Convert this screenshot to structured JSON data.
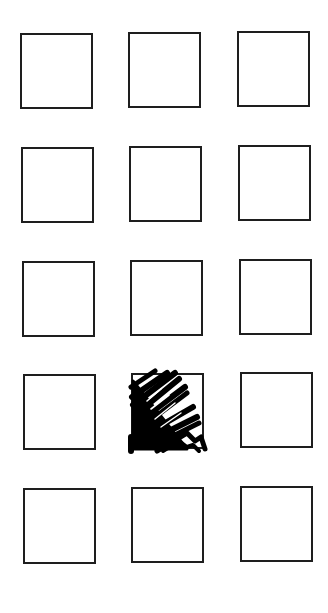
{
  "form": {
    "rows": 5,
    "columns": 3,
    "box_color": "#1e1e1e",
    "mark_color": "#000000",
    "boxes": [
      {
        "row": 1,
        "col": 1,
        "x": 20,
        "y": 33,
        "marked": false
      },
      {
        "row": 1,
        "col": 2,
        "x": 128,
        "y": 32,
        "marked": false
      },
      {
        "row": 1,
        "col": 3,
        "x": 237,
        "y": 31,
        "marked": false
      },
      {
        "row": 2,
        "col": 1,
        "x": 21,
        "y": 147,
        "marked": false
      },
      {
        "row": 2,
        "col": 2,
        "x": 129,
        "y": 146,
        "marked": false
      },
      {
        "row": 2,
        "col": 3,
        "x": 238,
        "y": 145,
        "marked": false
      },
      {
        "row": 3,
        "col": 1,
        "x": 22,
        "y": 261,
        "marked": false
      },
      {
        "row": 3,
        "col": 2,
        "x": 130,
        "y": 260,
        "marked": false
      },
      {
        "row": 3,
        "col": 3,
        "x": 239,
        "y": 259,
        "marked": false
      },
      {
        "row": 4,
        "col": 1,
        "x": 23,
        "y": 374,
        "marked": false
      },
      {
        "row": 4,
        "col": 2,
        "x": 131,
        "y": 373,
        "marked": true
      },
      {
        "row": 4,
        "col": 3,
        "x": 240,
        "y": 372,
        "marked": false
      },
      {
        "row": 5,
        "col": 1,
        "x": 23,
        "y": 488,
        "marked": false
      },
      {
        "row": 5,
        "col": 2,
        "x": 131,
        "y": 487,
        "marked": false
      },
      {
        "row": 5,
        "col": 3,
        "x": 240,
        "y": 486,
        "marked": false
      }
    ]
  }
}
